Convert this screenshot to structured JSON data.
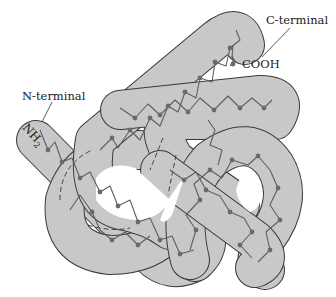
{
  "figure": {
    "colors": {
      "tube_fill": "#c8c8c8",
      "tube_outline": "#3a3a3a",
      "chain": "#5e5e5e",
      "residue": "#6a6a6a",
      "background": "#ffffff"
    }
  },
  "labels": {
    "c_terminal": "C-terminal",
    "cooh": "COOH",
    "n_terminal": "N-terminal",
    "nh2_main": "NH",
    "nh2_sub": "2"
  }
}
